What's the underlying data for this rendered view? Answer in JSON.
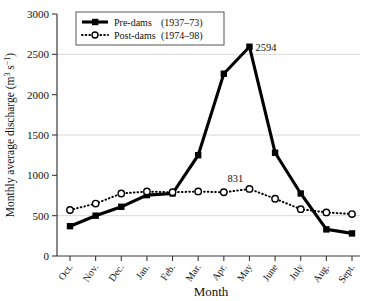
{
  "chart_data": {
    "type": "line",
    "title": "",
    "xlabel": "Month",
    "ylabel": "Monthly average discharge (m³ s⁻¹)",
    "categories": [
      "Oct.",
      "Nov.",
      "Dec.",
      "Jan.",
      "Feb.",
      "Mar.",
      "Apr.",
      "May",
      "June",
      "July",
      "Aug.",
      "Sept."
    ],
    "ylim": [
      0,
      3000
    ],
    "ytick_values": [
      0,
      500,
      1000,
      1500,
      2000,
      2500,
      3000
    ],
    "ytick_labels": [
      "0",
      "500",
      "1000",
      "1500",
      "2000",
      "2500",
      "3000"
    ],
    "gridlines": [
      500,
      1500,
      2500
    ],
    "grid": true,
    "legend_position": "top-left",
    "series": [
      {
        "name": "Pre-dams",
        "period": "(1937–73)",
        "marker": "filled-square",
        "line_style": "solid",
        "values": [
          370,
          500,
          610,
          755,
          775,
          1250,
          2260,
          2594,
          1280,
          775,
          330,
          280
        ]
      },
      {
        "name": "Post-dams",
        "period": "(1974–98)",
        "marker": "open-circle",
        "line_style": "dotted",
        "values": [
          570,
          650,
          775,
          800,
          790,
          800,
          790,
          831,
          710,
          580,
          540,
          520
        ]
      }
    ],
    "annotations": [
      {
        "label": "2594",
        "series": "Pre-dams",
        "category": "May",
        "value": 2594
      },
      {
        "label": "831",
        "series": "Post-dams",
        "category": "May",
        "value": 831
      }
    ]
  },
  "legend": {
    "entries": [
      {
        "label": "Pre-dams",
        "period": "(1937–73)"
      },
      {
        "label": "Post-dams",
        "period": "(1974–98)"
      }
    ]
  },
  "axes": {
    "y_title": "Monthly average discharge (m³ s⁻¹)",
    "x_title": "Month"
  }
}
